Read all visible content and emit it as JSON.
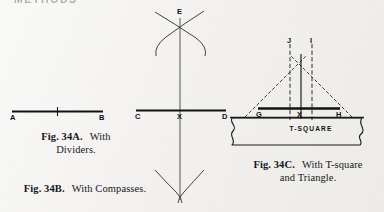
{
  "running_head": "METHODS",
  "page": {
    "background_color": "#f3f2f0",
    "ink_color": "#141414"
  },
  "figures": [
    {
      "id": "fig-34a",
      "number": "Fig. 34A.",
      "description_line1": "With",
      "description_line2": "Dividers.",
      "method": "dividers",
      "point_labels": [
        "A",
        "B"
      ],
      "midpoint_mark": "tick"
    },
    {
      "id": "fig-34b",
      "number": "Fig. 34B.",
      "description_line1": "With Compasses.",
      "description_line2": "",
      "method": "compasses",
      "point_labels": [
        "E",
        "C",
        "X",
        "D"
      ]
    },
    {
      "id": "fig-34c",
      "number": "Fig. 34C.",
      "description_line1": "With T-square",
      "description_line2": "and Triangle.",
      "method": "t-square-and-triangle",
      "point_labels": [
        "J",
        "I",
        "G",
        "X",
        "H"
      ],
      "tool_label": "T-SQUARE"
    }
  ],
  "labels": {
    "a": "A",
    "b": "B",
    "c": "C",
    "d": "D",
    "e": "E",
    "g": "G",
    "h": "H",
    "i": "I",
    "j": "J",
    "x_b": "X",
    "x_c": "X",
    "tsquare": "T-SQUARE"
  }
}
